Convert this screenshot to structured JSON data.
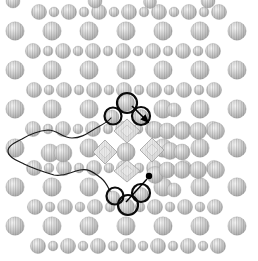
{
  "figure": {
    "canvas": {
      "width": 258,
      "height": 261,
      "background": "#ffffff"
    },
    "colors": {
      "atom_center": "#f5f5f5",
      "atom_mid": "#cbcbcb",
      "atom_edge": "#a6a6a6",
      "atom_outline": "#8f8f8f",
      "stripe": "#6f6f6f",
      "lobe_light": "#f1f1f1",
      "lobe_dark": "#d5d5d5",
      "lobe_inner": "#e9e9e9",
      "lobe_outline": "#a0a0a0",
      "ring_stroke": "#0a0a0a",
      "contour_stroke": "#1a1a1a",
      "marker_fill": "#000000"
    },
    "lattice": {
      "dense_rows": {
        "ys": [
          12,
          51,
          90,
          129,
          168,
          207,
          246
        ],
        "x_starts": [
          39,
          33,
          34,
          33,
          34,
          35,
          38
        ],
        "x_step": 15,
        "count": 13,
        "r_big": 7.6,
        "r_small": 4.9
      },
      "sparse_rows": {
        "ys": [
          31,
          70,
          109,
          148,
          187,
          226
        ],
        "xs": [
          15,
          52,
          89,
          126,
          163,
          200,
          237
        ],
        "r": 9.2
      },
      "edge_partials": [
        {
          "x": 13,
          "y": 1,
          "r": 7
        },
        {
          "x": 95,
          "y": 1,
          "r": 7
        },
        {
          "x": 150,
          "y": 2,
          "r": 6.5
        },
        {
          "x": 208,
          "y": 1,
          "r": 7
        }
      ],
      "excluded_sites": [
        {
          "x": 126,
          "y": 109
        },
        {
          "x": 126,
          "y": 148
        },
        {
          "x": 126,
          "y": 187
        },
        {
          "x": 52,
          "y": 148
        }
      ]
    },
    "displaced_atoms": [
      {
        "x": 126,
        "y": 103,
        "r": 8.5
      },
      {
        "x": 112,
        "y": 117,
        "r": 7
      },
      {
        "x": 141,
        "y": 117,
        "r": 7.5
      },
      {
        "x": 155,
        "y": 130,
        "r": 8.5
      },
      {
        "x": 126,
        "y": 152,
        "r": 9
      },
      {
        "x": 113,
        "y": 198,
        "r": 7
      },
      {
        "x": 141,
        "y": 195,
        "r": 7.5
      },
      {
        "x": 126,
        "y": 207,
        "r": 8.5
      },
      {
        "x": 155,
        "y": 175,
        "r": 8.5
      },
      {
        "x": 50,
        "y": 153,
        "r": 9
      },
      {
        "x": 63,
        "y": 153,
        "r": 9
      },
      {
        "x": 167,
        "y": 131,
        "r": 8
      },
      {
        "x": 182,
        "y": 131,
        "r": 8.5
      },
      {
        "x": 198,
        "y": 131,
        "r": 8.5
      },
      {
        "x": 216,
        "y": 131,
        "r": 8.5
      },
      {
        "x": 170,
        "y": 151,
        "r": 8.5
      },
      {
        "x": 182,
        "y": 152,
        "r": 8
      },
      {
        "x": 167,
        "y": 170,
        "r": 8
      },
      {
        "x": 182,
        "y": 170,
        "r": 8.5
      },
      {
        "x": 198,
        "y": 170,
        "r": 8.5
      },
      {
        "x": 216,
        "y": 170,
        "r": 8.5
      },
      {
        "x": 174,
        "y": 110,
        "r": 7
      },
      {
        "x": 174,
        "y": 190,
        "r": 7
      }
    ],
    "orbital_lobes": [
      {
        "cx": 127,
        "cy": 131,
        "rx": 13,
        "ry": 12
      },
      {
        "cx": 105,
        "cy": 152,
        "rx": 12,
        "ry": 12
      },
      {
        "cx": 152,
        "cy": 150,
        "rx": 12,
        "ry": 12
      },
      {
        "cx": 127,
        "cy": 171,
        "rx": 13,
        "ry": 11
      }
    ],
    "highlight_rings": [
      {
        "cx": 127,
        "cy": 103,
        "r": 10
      },
      {
        "cx": 113,
        "cy": 116,
        "r": 8.5
      },
      {
        "cx": 141,
        "cy": 116,
        "r": 9
      },
      {
        "cx": 115,
        "cy": 196,
        "r": 8.5
      },
      {
        "cx": 141,
        "cy": 193,
        "r": 9
      },
      {
        "cx": 128,
        "cy": 205,
        "r": 10
      }
    ],
    "contour_path": "M 111 118 C 107 123 99 126 93 130 C 85 135 80 138 72 138 C 62 138 58 130 48 130 C 38 131 30 134 22 139 C 14 143 8 146 8 151 C 8 157 16 160 24 164 C 34 169 44 172 54 175 C 64 177 70 172 80 170 C 90 168 95 174 101 178 C 106 182 108 187 110 191",
    "arrow": {
      "x1": 132,
      "y1": 106,
      "x2": 148,
      "y2": 122
    },
    "dot": {
      "cx": 149,
      "cy": 176,
      "r": 3.2
    },
    "dot_line": {
      "x1": 147,
      "y1": 179,
      "x2": 126,
      "y2": 202
    }
  }
}
